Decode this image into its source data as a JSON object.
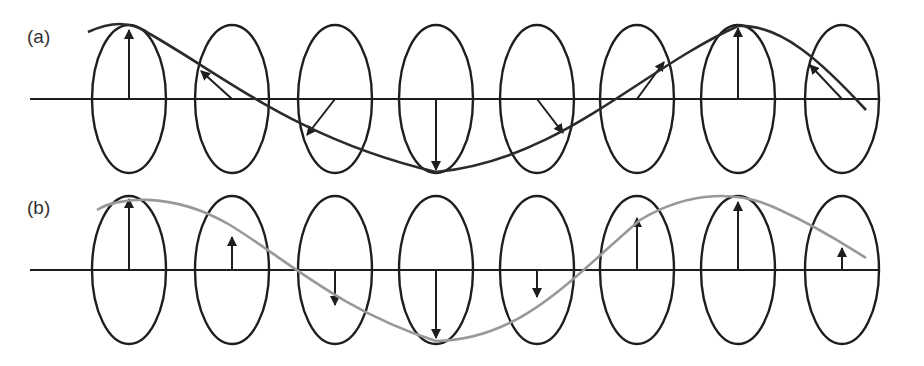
{
  "figure": {
    "panels": [
      {
        "id": "a",
        "label": "(a)",
        "axis_y": 99,
        "description": "Circularly polarized wave: field vector rotates around propagation axis at each ellipse",
        "curve_color": "#2b2b2b",
        "vectors": [
          {
            "cx": 129,
            "tip": [
              129,
              30
            ]
          },
          {
            "cx": 232,
            "tip": [
              201,
              71
            ]
          },
          {
            "cx": 335,
            "tip": [
              307,
              135
            ]
          },
          {
            "cx": 436,
            "tip": [
              432,
              170
            ]
          },
          {
            "cx": 537,
            "tip": [
              563,
              133
            ]
          },
          {
            "cx": 637,
            "tip": [
              664,
              62
            ]
          },
          {
            "cx": 738,
            "tip": [
              738,
              28
            ]
          },
          {
            "cx": 842,
            "tip": [
              810,
              65
            ]
          }
        ]
      },
      {
        "id": "b",
        "label": "(b)",
        "axis_y": 270,
        "description": "Linearly polarized wave: field vector oscillates vertically at each ellipse",
        "curve_color": "#999999",
        "vectors": [
          {
            "cx": 129,
            "tip": [
              129,
              199
            ]
          },
          {
            "cx": 232,
            "tip": [
              232,
              237
            ]
          },
          {
            "cx": 335,
            "tip": [
              335,
              305
            ]
          },
          {
            "cx": 436,
            "tip": [
              436,
              338
            ]
          },
          {
            "cx": 537,
            "tip": [
              537,
              297
            ]
          },
          {
            "cx": 637,
            "tip": [
              637,
              218
            ]
          },
          {
            "cx": 738,
            "tip": [
              738,
              202
            ]
          },
          {
            "cx": 842,
            "tip": [
              842,
              248
            ]
          }
        ]
      }
    ],
    "ellipse": {
      "rx": 37,
      "ry": 74
    },
    "stroke_color": "#1e1e1e"
  }
}
